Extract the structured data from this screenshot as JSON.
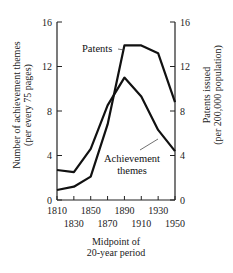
{
  "chart_data": {
    "type": "line",
    "title": "",
    "x": [
      1810,
      1830,
      1850,
      1870,
      1890,
      1910,
      1930,
      1950
    ],
    "x_tick_labels_top_row": [
      "1810",
      "1850",
      "1890",
      "1930"
    ],
    "x_tick_labels_bottom_row": [
      "1830",
      "1870",
      "1910",
      "1950"
    ],
    "xlabel": [
      "Midpoint of",
      "20-year period"
    ],
    "ylabel_left": [
      "Number of achievement themes",
      "(per every 75 pages)"
    ],
    "ylabel_right": [
      "Patents issued",
      "(per 200,000 population)"
    ],
    "ylim_left": [
      0,
      16
    ],
    "ylim_right": [
      0,
      16
    ],
    "y_ticks_left": [
      "0",
      "4",
      "8",
      "12",
      "16"
    ],
    "y_ticks_right": [
      "0",
      "4",
      "8",
      "12",
      "16"
    ],
    "grid": false,
    "legend": "inline annotations",
    "series": [
      {
        "name": "Achievement themes",
        "axis": "left",
        "values": [
          2.7,
          2.5,
          4.6,
          8.5,
          11.0,
          9.3,
          6.3,
          4.4
        ]
      },
      {
        "name": "Patents",
        "axis": "right",
        "values": [
          0.9,
          1.2,
          2.1,
          6.8,
          13.9,
          13.9,
          13.2,
          8.8
        ]
      }
    ],
    "annotations": [
      {
        "text": "Patents",
        "points_to": "Patents"
      },
      {
        "text": [
          "Achievement",
          "themes"
        ],
        "points_to": "Achievement themes"
      }
    ]
  }
}
